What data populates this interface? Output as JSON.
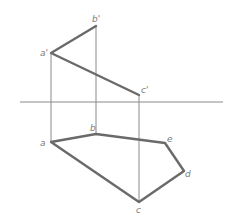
{
  "diagram": {
    "type": "orthographic-projection",
    "axis": {
      "x1": 20,
      "x2": 223,
      "y": 102
    },
    "front_view": {
      "points": [
        {
          "id": "a1",
          "label": "a'",
          "x": 51,
          "y": 53,
          "lx": 40,
          "ly": 56
        },
        {
          "id": "b1",
          "label": "b'",
          "x": 96,
          "y": 26,
          "lx": 92,
          "ly": 22
        },
        {
          "id": "c1",
          "label": "c'",
          "x": 139,
          "y": 95,
          "lx": 141,
          "ly": 93
        }
      ],
      "polyline": "96,26 51,53 139,95"
    },
    "top_view": {
      "points": [
        {
          "id": "a",
          "label": "a",
          "x": 51,
          "y": 142,
          "lx": 40,
          "ly": 146
        },
        {
          "id": "b",
          "label": "b",
          "x": 96,
          "y": 134,
          "lx": 90,
          "ly": 131
        },
        {
          "id": "e",
          "label": "e",
          "x": 165,
          "y": 143,
          "lx": 167,
          "ly": 142
        },
        {
          "id": "d",
          "label": "d",
          "x": 184,
          "y": 171,
          "lx": 185,
          "ly": 177
        },
        {
          "id": "c",
          "label": "c",
          "x": 139,
          "y": 202,
          "lx": 136,
          "ly": 213
        }
      ],
      "polygon": "51,142 96,134 165,143 184,171 139,202"
    },
    "projection_lines": [
      {
        "x": 51,
        "y1": 53,
        "y2": 142
      },
      {
        "x": 96,
        "y1": 26,
        "y2": 134
      },
      {
        "x": 139,
        "y1": 95,
        "y2": 202
      }
    ],
    "colors": {
      "thick_line": "#6a6a6a",
      "thin_line": "#8a8a8a",
      "label": "#7a7a7a"
    }
  }
}
